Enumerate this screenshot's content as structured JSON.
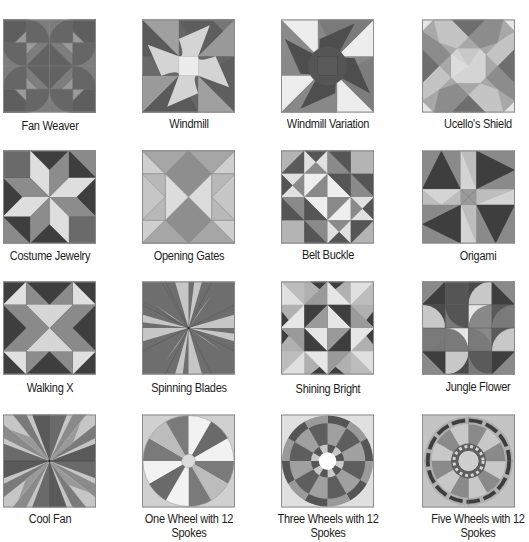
{
  "page": {
    "colors": {
      "background": "#ffffff",
      "darkest": "#3a3a3a",
      "dark": "#5e5e5e",
      "mid": "#7d7d7d",
      "light": "#a8a8a8",
      "lighter": "#c6c6c6",
      "lightest": "#e6e6e6",
      "border": "#8a8a8a"
    }
  },
  "blocks": [
    {
      "name": "Fan Weaver",
      "row": 0,
      "col": 0
    },
    {
      "name": "Windmill",
      "row": 0,
      "col": 1
    },
    {
      "name": "Windmill Variation",
      "row": 0,
      "col": 2
    },
    {
      "name": "Ucello's Shield",
      "row": 0,
      "col": 3
    },
    {
      "name": "Costume Jewelry",
      "row": 1,
      "col": 0
    },
    {
      "name": "Opening Gates",
      "row": 1,
      "col": 1
    },
    {
      "name": "Belt Buckle",
      "row": 1,
      "col": 2
    },
    {
      "name": "Origami",
      "row": 1,
      "col": 3
    },
    {
      "name": "Walking X",
      "row": 2,
      "col": 0
    },
    {
      "name": "Spinning Blades",
      "row": 2,
      "col": 1
    },
    {
      "name": "Shining Bright",
      "row": 2,
      "col": 2
    },
    {
      "name": "Jungle Flower",
      "row": 2,
      "col": 3
    },
    {
      "name": "Cool Fan",
      "row": 3,
      "col": 0
    },
    {
      "name": "One Wheel with 12 Spokes",
      "name_lines": [
        "One Wheel with 12",
        "Spokes"
      ],
      "row": 3,
      "col": 1
    },
    {
      "name": "Three Wheels with 12 Spokes",
      "name_lines": [
        "Three Wheels with 12",
        "Spokes"
      ],
      "row": 3,
      "col": 2
    },
    {
      "name": "Five Wheels with 12 Spokes",
      "name_lines": [
        "Five Wheels with 12",
        "Spokes"
      ],
      "row": 3,
      "col": 3
    }
  ]
}
